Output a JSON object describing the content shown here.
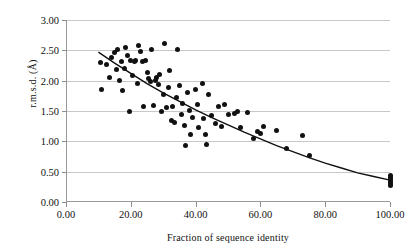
{
  "chart_data": {
    "type": "scatter",
    "title": "",
    "xlabel": "Fraction of sequence identity",
    "ylabel": "r.m.s.d. (Å)",
    "xlim": [
      0,
      100
    ],
    "ylim": [
      0,
      3.0
    ],
    "xticks": [
      "0.00",
      "20.00",
      "40.00",
      "60.00",
      "80.00",
      "100.00"
    ],
    "xtick_values": [
      0,
      20,
      40,
      60,
      80,
      100
    ],
    "yticks": [
      "0.00",
      "0.50",
      "1.00",
      "1.50",
      "2.00",
      "2.50",
      "3.00"
    ],
    "ytick_values": [
      0,
      0.5,
      1.0,
      1.5,
      2.0,
      2.5,
      3.0
    ],
    "grid": "horizontal",
    "legend": "none",
    "marker": "filled-circle",
    "marker_color": "#111111",
    "grid_color": "#c8c8c8",
    "axis_color": "#9a9a9a",
    "series": [
      {
        "name": "structure pairs",
        "points": [
          [
            10.5,
            2.3
          ],
          [
            11.0,
            1.86
          ],
          [
            12.5,
            2.27
          ],
          [
            13.5,
            2.05
          ],
          [
            14.0,
            2.38
          ],
          [
            15.0,
            2.46
          ],
          [
            15.5,
            2.18
          ],
          [
            16.0,
            2.52
          ],
          [
            16.5,
            2.01
          ],
          [
            17.0,
            2.32
          ],
          [
            17.5,
            1.84
          ],
          [
            18.0,
            2.2
          ],
          [
            18.5,
            2.55
          ],
          [
            19.0,
            2.41
          ],
          [
            19.5,
            1.5
          ],
          [
            20.0,
            2.33
          ],
          [
            20.5,
            2.09
          ],
          [
            21.0,
            2.32
          ],
          [
            21.5,
            2.33
          ],
          [
            22.0,
            1.96
          ],
          [
            22.5,
            2.58
          ],
          [
            23.0,
            2.48
          ],
          [
            23.5,
            2.31
          ],
          [
            24.0,
            1.57
          ],
          [
            24.5,
            2.33
          ],
          [
            25.0,
            2.13
          ],
          [
            25.5,
            2.04
          ],
          [
            26.0,
            1.99
          ],
          [
            26.5,
            2.51
          ],
          [
            27.0,
            1.59
          ],
          [
            27.5,
            2.0
          ],
          [
            28.0,
            2.06
          ],
          [
            28.5,
            1.93
          ],
          [
            29.0,
            2.1
          ],
          [
            29.5,
            1.49
          ],
          [
            30.0,
            1.77
          ],
          [
            30.5,
            2.61
          ],
          [
            31.0,
            1.55
          ],
          [
            31.5,
            1.88
          ],
          [
            32.0,
            2.16
          ],
          [
            32.5,
            1.35
          ],
          [
            33.0,
            1.57
          ],
          [
            33.5,
            1.31
          ],
          [
            34.0,
            1.73
          ],
          [
            34.5,
            2.51
          ],
          [
            35.0,
            1.92
          ],
          [
            35.5,
            1.45
          ],
          [
            36.0,
            1.63
          ],
          [
            36.5,
            1.26
          ],
          [
            37.0,
            0.93
          ],
          [
            37.5,
            1.8
          ],
          [
            38.0,
            1.51
          ],
          [
            38.5,
            1.11
          ],
          [
            39.0,
            1.4
          ],
          [
            40.0,
            1.85
          ],
          [
            40.5,
            1.6
          ],
          [
            41.0,
            1.23
          ],
          [
            42.0,
            1.95
          ],
          [
            42.5,
            1.37
          ],
          [
            43.0,
            1.12
          ],
          [
            43.5,
            0.94
          ],
          [
            44.0,
            1.77
          ],
          [
            45.0,
            1.42
          ],
          [
            46.0,
            1.3
          ],
          [
            47.0,
            1.57
          ],
          [
            48.0,
            1.25
          ],
          [
            49.0,
            1.6
          ],
          [
            50.0,
            1.44
          ],
          [
            52.0,
            1.46
          ],
          [
            53.0,
            1.5
          ],
          [
            54.0,
            1.22
          ],
          [
            56.0,
            1.48
          ],
          [
            58.0,
            1.05
          ],
          [
            59.0,
            1.17
          ],
          [
            60.0,
            1.13
          ],
          [
            61.0,
            1.25
          ],
          [
            65.0,
            1.18
          ],
          [
            68.0,
            0.88
          ],
          [
            73.0,
            1.1
          ],
          [
            75.0,
            0.77
          ],
          [
            100.0,
            0.4
          ],
          [
            100.0,
            0.37
          ],
          [
            100.0,
            0.34
          ],
          [
            100.0,
            0.31
          ],
          [
            100.0,
            0.44
          ],
          [
            100.0,
            0.28
          ]
        ]
      }
    ],
    "trendline": {
      "type": "exponential-decay",
      "description": "fitted decreasing curve through the scatter",
      "points": [
        [
          10,
          2.47
        ],
        [
          15,
          2.29
        ],
        [
          20,
          2.12
        ],
        [
          25,
          1.95
        ],
        [
          30,
          1.8
        ],
        [
          35,
          1.66
        ],
        [
          40,
          1.52
        ],
        [
          45,
          1.39
        ],
        [
          50,
          1.27
        ],
        [
          55,
          1.15
        ],
        [
          60,
          1.04
        ],
        [
          65,
          0.93
        ],
        [
          70,
          0.83
        ],
        [
          75,
          0.73
        ],
        [
          80,
          0.64
        ],
        [
          85,
          0.56
        ],
        [
          90,
          0.48
        ],
        [
          95,
          0.42
        ],
        [
          100,
          0.36
        ]
      ]
    }
  }
}
